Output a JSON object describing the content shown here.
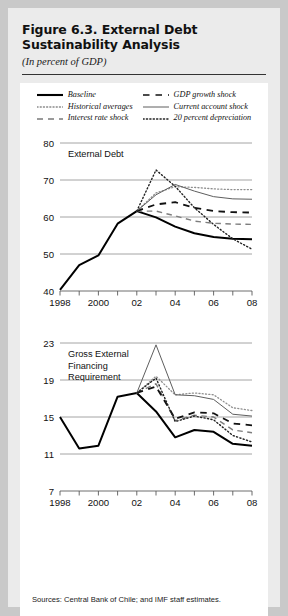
{
  "figure": {
    "title": "Figure 6.3. External Debt Sustainability Analysis",
    "subtitle": "(In percent of GDP)",
    "source_note": "Sources: Central Bank of Chile; and IMF staff estimates."
  },
  "legend": {
    "columns": [
      [
        {
          "label": "Baseline",
          "style": "solid-thick-black",
          "color": "#000000"
        },
        {
          "label": "Historical averages",
          "style": "dotted-gray",
          "color": "#888888"
        },
        {
          "label": "Interest rate shock",
          "style": "dashed-gray",
          "color": "#777777"
        }
      ],
      [
        {
          "label": "GDP growth shock",
          "style": "dashed-black",
          "color": "#111111"
        },
        {
          "label": "Current account shock",
          "style": "solid-thin-gray",
          "color": "#666666"
        },
        {
          "label": "20 percent depreciation",
          "style": "dotted-black",
          "color": "#222222"
        }
      ]
    ]
  },
  "chart_data": [
    {
      "type": "line",
      "title": "External Debt",
      "xlabel": "",
      "ylabel": "",
      "xlim": [
        1998,
        2008
      ],
      "ylim": [
        40,
        80
      ],
      "yticks": [
        40,
        50,
        60,
        70,
        80
      ],
      "ytick_labels": [
        "40",
        "50",
        "60",
        "70",
        "80"
      ],
      "x": [
        1998,
        1999,
        2000,
        2001,
        2002,
        2003,
        2004,
        2005,
        2006,
        2007,
        2008
      ],
      "xtick_labels": [
        "1998",
        "",
        "2000",
        "",
        "02",
        "",
        "04",
        "",
        "06",
        "",
        "08"
      ],
      "grid": "horizontal",
      "legend_position": "above-figure",
      "series": [
        {
          "name": "Baseline",
          "style": "solid-thick-black",
          "values": [
            40.3,
            47.0,
            49.6,
            58.2,
            61.6,
            59.9,
            57.4,
            55.6,
            54.6,
            54.1,
            54.0
          ]
        },
        {
          "name": "Historical averages",
          "style": "dotted-gray",
          "values": [
            null,
            null,
            null,
            null,
            61.6,
            66.5,
            68.2,
            68.0,
            67.6,
            67.4,
            67.4
          ]
        },
        {
          "name": "Interest rate shock",
          "style": "dashed-gray",
          "values": [
            null,
            null,
            null,
            null,
            61.6,
            61.6,
            60.3,
            58.9,
            58.3,
            58.1,
            58.0
          ]
        },
        {
          "name": "GDP growth shock",
          "style": "dashed-black",
          "values": [
            null,
            null,
            null,
            null,
            61.6,
            63.4,
            64.0,
            62.5,
            61.6,
            61.3,
            61.2
          ]
        },
        {
          "name": "Current account shock",
          "style": "solid-thin-gray",
          "values": [
            null,
            null,
            null,
            null,
            61.6,
            66.0,
            68.8,
            67.0,
            65.5,
            64.9,
            64.8
          ]
        },
        {
          "name": "20 percent depreciation",
          "style": "dotted-black",
          "values": [
            null,
            null,
            null,
            null,
            61.6,
            72.7,
            68.3,
            62.5,
            58.0,
            54.1,
            51.3
          ]
        }
      ]
    },
    {
      "type": "line",
      "title": "Gross External Financing Requirement",
      "xlabel": "",
      "ylabel": "",
      "xlim": [
        1998,
        2008
      ],
      "ylim": [
        7,
        23
      ],
      "yticks": [
        7,
        11,
        15,
        19,
        23
      ],
      "ytick_labels": [
        "7",
        "11",
        "15",
        "19",
        "23"
      ],
      "x": [
        1998,
        1999,
        2000,
        2001,
        2002,
        2003,
        2004,
        2005,
        2006,
        2007,
        2008
      ],
      "xtick_labels": [
        "1998",
        "",
        "2000",
        "",
        "02",
        "",
        "04",
        "",
        "06",
        "",
        "08"
      ],
      "grid": "horizontal",
      "legend_position": "above-figure",
      "series": [
        {
          "name": "Baseline",
          "style": "solid-thick-black",
          "values": [
            15.0,
            11.6,
            11.9,
            17.2,
            17.6,
            15.6,
            12.8,
            13.6,
            13.4,
            12.1,
            11.9
          ]
        },
        {
          "name": "Historical averages",
          "style": "dotted-gray",
          "values": [
            null,
            null,
            null,
            null,
            17.6,
            19.4,
            17.4,
            17.6,
            17.4,
            16.0,
            15.7
          ]
        },
        {
          "name": "Interest rate shock",
          "style": "dashed-gray",
          "values": [
            null,
            null,
            null,
            null,
            17.6,
            18.6,
            14.6,
            15.2,
            15.0,
            13.6,
            13.3
          ]
        },
        {
          "name": "GDP growth shock",
          "style": "dashed-black",
          "values": [
            null,
            null,
            null,
            null,
            17.6,
            18.3,
            14.8,
            15.5,
            15.4,
            14.3,
            14.1
          ]
        },
        {
          "name": "Current account shock",
          "style": "solid-thin-gray",
          "values": [
            null,
            null,
            null,
            null,
            17.6,
            22.8,
            17.4,
            17.3,
            16.9,
            15.3,
            15.1
          ]
        },
        {
          "name": "20 percent depreciation",
          "style": "dotted-black",
          "values": [
            null,
            null,
            null,
            null,
            17.6,
            19.2,
            14.5,
            15.1,
            14.7,
            13.0,
            12.3
          ]
        }
      ]
    }
  ]
}
